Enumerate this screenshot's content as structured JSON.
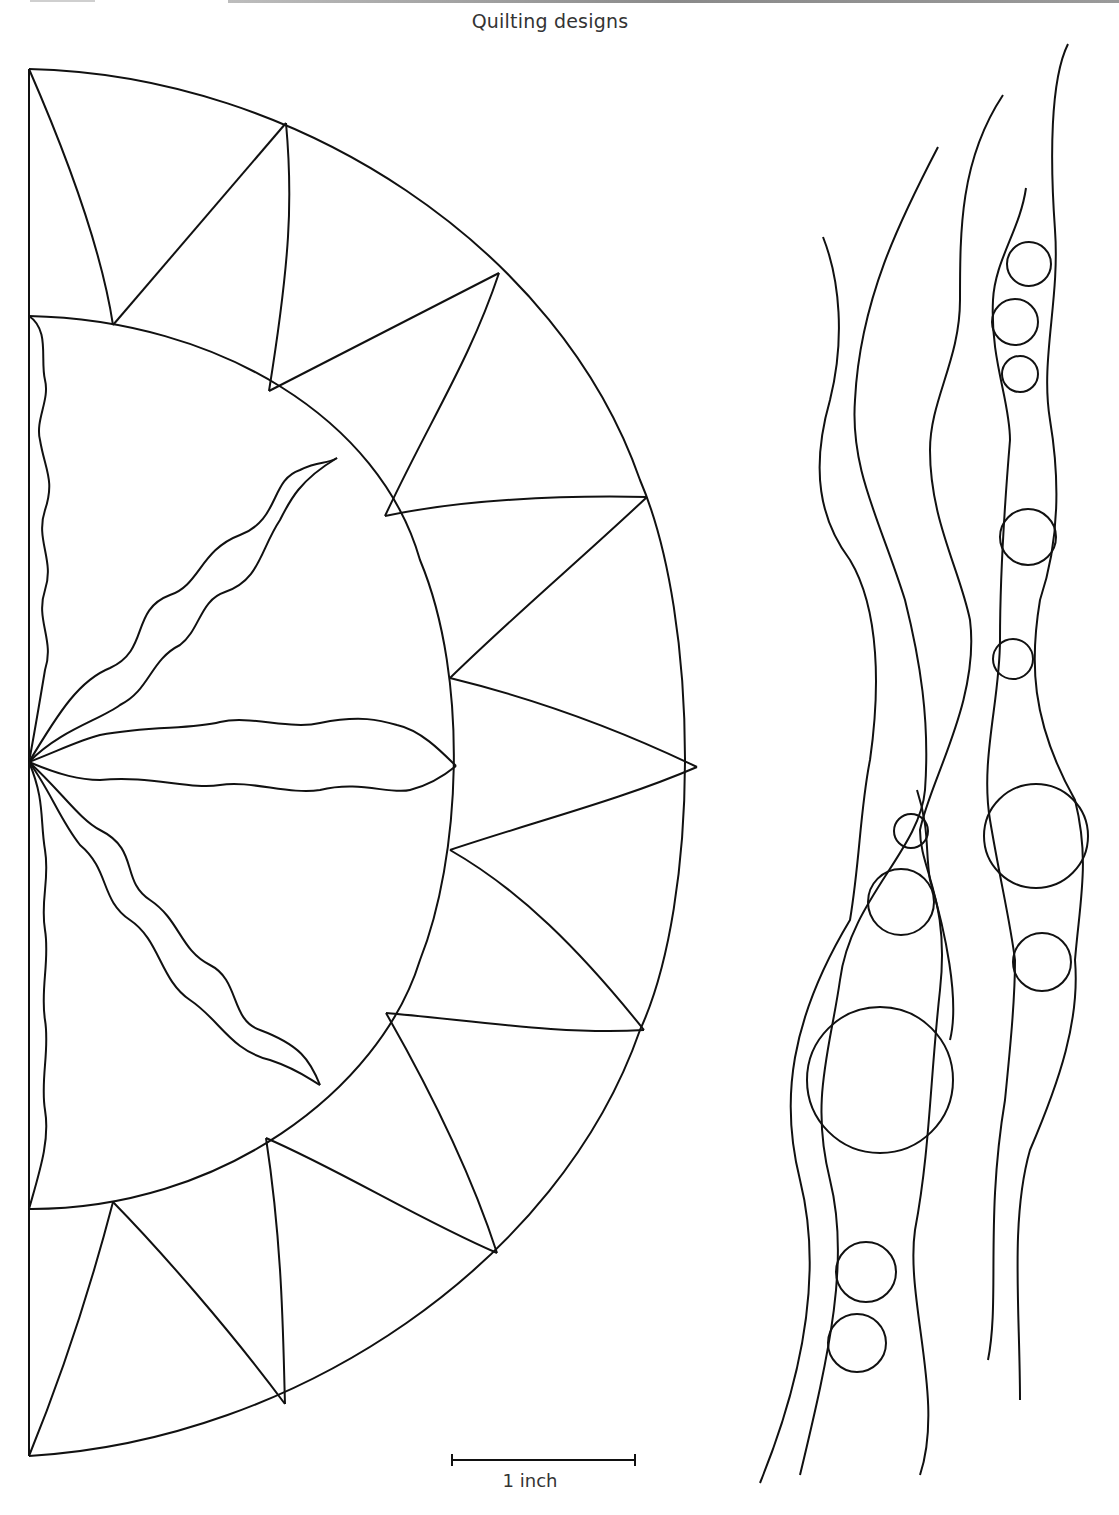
{
  "page": {
    "title": "Quilting designs",
    "scale_bar": {
      "label": "1 inch",
      "x1": 452,
      "x2": 635,
      "y": 1460
    }
  },
  "designs": [
    {
      "name": "sunburst-half-circle",
      "description": "Half-circle sunburst with wavy rays and pointed outer ring"
    },
    {
      "name": "flowing-lines-with-circles",
      "description": "Vertical wavy lines with bubble circles"
    }
  ],
  "style": {
    "stroke": "#111111",
    "background": "#ffffff",
    "text": "#333333"
  }
}
